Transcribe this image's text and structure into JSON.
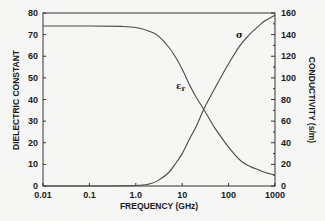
{
  "chart_data": {
    "type": "line",
    "title": "",
    "xlabel": "FREQUENCY (GHz)",
    "ylabel": "DIELECTRIC CONSTANT",
    "y2label": "CONDUCTIVITY (s/m)",
    "xscale": "log",
    "xlim": [
      0.01,
      1000
    ],
    "ylim": [
      0,
      80
    ],
    "y2lim": [
      0,
      160
    ],
    "grid": false,
    "legend": "none (inline curve labels)",
    "x_ticks": [
      "0.01",
      "0.1",
      "1.0",
      "10",
      "100",
      "1000"
    ],
    "y_ticks": [
      "0",
      "10",
      "20",
      "30",
      "40",
      "50",
      "60",
      "70",
      "80"
    ],
    "y2_ticks": [
      "0",
      "20",
      "40",
      "60",
      "80",
      "100",
      "120",
      "140",
      "160"
    ],
    "series": [
      {
        "name": "εr",
        "axis": "left",
        "x": [
          0.01,
          0.1,
          0.5,
          1,
          2,
          3,
          5,
          7,
          10,
          15,
          20,
          30,
          50,
          100,
          200,
          500,
          1000
        ],
        "values": [
          74,
          74,
          73.8,
          73.3,
          71.5,
          69.5,
          64.5,
          60,
          54,
          46,
          41,
          35,
          27,
          18,
          11,
          7,
          5
        ]
      },
      {
        "name": "σ",
        "axis": "right",
        "x": [
          0.01,
          0.1,
          1,
          2,
          3,
          5,
          7,
          10,
          15,
          20,
          30,
          50,
          100,
          200,
          500,
          1000
        ],
        "values": [
          0,
          0,
          0.5,
          2,
          5,
          12,
          20,
          30,
          45,
          55,
          72,
          90,
          113,
          133,
          150,
          158
        ]
      }
    ],
    "annotations": [
      {
        "text": "εr",
        "near": "descending curve around 10 GHz"
      },
      {
        "text": "σ",
        "near": "rising curve around 200 GHz"
      }
    ]
  },
  "labels": {
    "eps_label": "ε",
    "eps_sub": "r",
    "sigma_label": "σ"
  },
  "colors": {
    "background": "#f6f6f4",
    "ink": "#1a1a1a",
    "curve": "#4a4a4a"
  }
}
